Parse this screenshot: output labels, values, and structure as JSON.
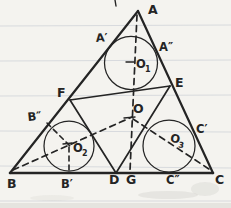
{
  "figure": {
    "vertices": {
      "a": "A",
      "b": "B",
      "c": "C"
    },
    "points": {
      "d": "D",
      "e": "E",
      "f": "F",
      "g": "G",
      "o": "O"
    },
    "tangent_points": {
      "a_prime": "A′",
      "a_double_prime": "A″",
      "b_prime": "B′",
      "b_double_prime": "B″",
      "c_prime": "C′",
      "c_double_prime": "C″"
    },
    "centers": {
      "o1": {
        "base": "O",
        "sub": "1"
      },
      "o2": {
        "base": "O",
        "sub": "2"
      },
      "o3": {
        "base": "O",
        "sub": "3"
      }
    },
    "colors": {
      "ink": "#242424",
      "paper": "#f4f3ef",
      "ruled_line": "#c6cbd3"
    }
  }
}
